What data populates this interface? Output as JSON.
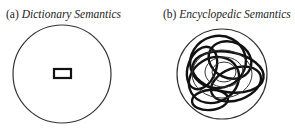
{
  "panels": [
    {
      "label": "(a)",
      "title": "Dictionary Semantics",
      "shape": "outer-circle-with-small-rectangle"
    },
    {
      "label": "(b)",
      "title": "Encyclopedic Semantics",
      "shape": "outer-circle-with-tangled-loops"
    }
  ]
}
